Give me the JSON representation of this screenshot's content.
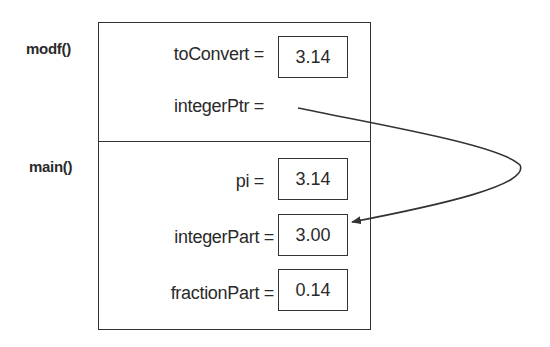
{
  "frames": {
    "modf": {
      "label": "modf()",
      "vars": [
        {
          "name": "toConvert =",
          "value": "3.14"
        },
        {
          "name": "integerPtr =",
          "value": null
        }
      ]
    },
    "main": {
      "label": "main()",
      "vars": [
        {
          "name": "pi =",
          "value": "3.14"
        },
        {
          "name": "integerPart =",
          "value": "3.00"
        },
        {
          "name": "fractionPart =",
          "value": "0.14"
        }
      ]
    }
  },
  "pointer": {
    "from": "integerPtr",
    "to": "integerPart"
  }
}
